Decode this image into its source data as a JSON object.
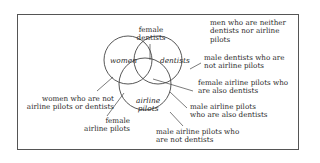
{
  "diagram": {
    "type": "venn",
    "sets": [
      {
        "id": "women",
        "label": "women"
      },
      {
        "id": "dentists",
        "label": "dentists"
      },
      {
        "id": "airline_pilots",
        "label_line1": "airline",
        "label_line2": "pilots"
      }
    ],
    "annotations": {
      "female_dentists": {
        "line1": "female",
        "line2": "dentists"
      },
      "men_neither": {
        "line1": "men who are neither",
        "line2": "dentists nor airline",
        "line3": "pilots"
      },
      "male_dentists_not_pilots": {
        "line1": "male dentists who are",
        "line2": "not airline pilots"
      },
      "female_pilots_dentists": {
        "line1": "female airline pilots who",
        "line2": "are also dentists"
      },
      "male_pilots_dentists": {
        "line1": "male airline pilots",
        "line2": "who are also dentists"
      },
      "male_pilots_not_dentists": {
        "line1": "male airline pilots who",
        "line2": "are not dentists"
      },
      "women_only": {
        "line1": "women who are not",
        "line2": "airline pilots or dentists"
      },
      "female_pilots": {
        "line1": "female",
        "line2": "airline pilots"
      }
    },
    "colors": {
      "stroke": "#444444",
      "text": "#2a2a2a",
      "background": "#ffffff"
    }
  }
}
